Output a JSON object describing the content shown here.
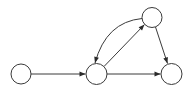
{
  "diagram": {
    "type": "directed-graph",
    "stroke_color": "#3a3a3a",
    "fill_color": "#ffffff",
    "nodes": [
      {
        "id": "n1",
        "label": "",
        "cx": 21,
        "cy": 74,
        "r": 10
      },
      {
        "id": "n2",
        "label": "",
        "cx": 96.5,
        "cy": 74,
        "r": 10.5
      },
      {
        "id": "n3",
        "label": "",
        "cx": 171.5,
        "cy": 74,
        "r": 10.5
      },
      {
        "id": "n4",
        "label": "",
        "cx": 152,
        "cy": 17.5,
        "r": 10
      }
    ],
    "edges": [
      {
        "from": "n1",
        "to": "n2",
        "style": "straight"
      },
      {
        "from": "n2",
        "to": "n3",
        "style": "straight"
      },
      {
        "from": "n2",
        "to": "n4",
        "style": "straight"
      },
      {
        "from": "n4",
        "to": "n2",
        "style": "curved"
      },
      {
        "from": "n4",
        "to": "n3",
        "style": "straight"
      }
    ]
  }
}
